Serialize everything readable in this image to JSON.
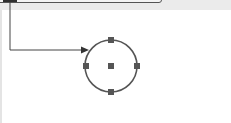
{
  "canvas": {
    "background": "#ffffff",
    "top_band_color": "#ebebeb",
    "stroke_color": "#555555",
    "handle_color": "#555555"
  },
  "shapes": {
    "box": {
      "type": "rectangle",
      "selected": true
    },
    "circle": {
      "type": "ellipse",
      "cx": 111,
      "cy": 66,
      "r": 26,
      "selected": true,
      "handles": [
        "top",
        "right",
        "bottom",
        "left",
        "center"
      ]
    }
  },
  "connector": {
    "from": "box",
    "to": "circle",
    "style": "orthogonal",
    "arrow": "end"
  }
}
